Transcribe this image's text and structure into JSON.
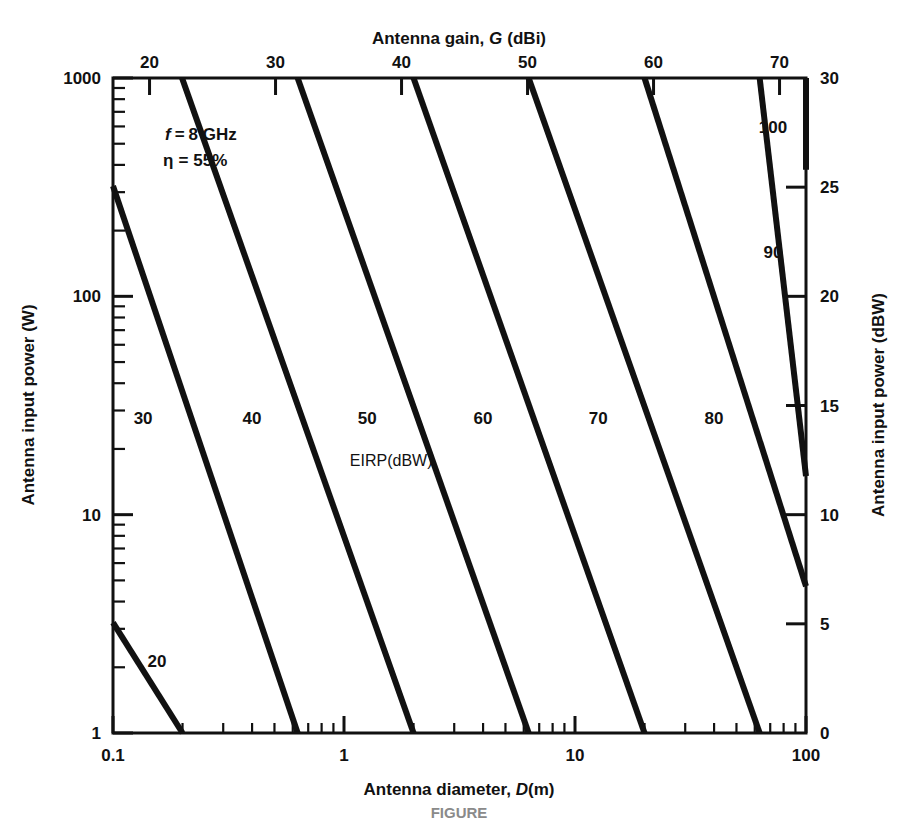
{
  "figure": {
    "kind": "nomogram",
    "caption_partial": "FIGURE",
    "background": "#ffffff",
    "ink": "#111111"
  },
  "annotations": {
    "frequency": {
      "symbol": "f",
      "relation": "=",
      "value": "8 GHz",
      "text": "f = 8 GHz"
    },
    "efficiency": {
      "symbol": "η",
      "relation": "=",
      "value": "55%",
      "text": "η = 55%"
    },
    "contour_family_label": "EIRP(dBW)"
  },
  "chart_data": {
    "type": "line",
    "title": "",
    "subtitle": "",
    "xlabel": "Antenna diameter, D(m)",
    "xlabel_symbol": "D",
    "xlabel_units": "(m)",
    "xlabel_prefix": "Antenna diameter, ",
    "ylabel": "Antenna input power (W)",
    "top_axis_label": "Antenna gain, G (dBi)",
    "top_axis_prefix": "Antenna gain, ",
    "top_axis_symbol": "G",
    "top_axis_units": "(dBi)",
    "right_axis_label": "Antenna input power (dBW)",
    "xscale": "log",
    "yscale": "log",
    "xlim": [
      0.1,
      100
    ],
    "ylim": [
      1,
      1000
    ],
    "grid": false,
    "legend_position": "inline-contour-labels",
    "x_ticks": [
      {
        "value": 0.1,
        "label": "0.1",
        "major": true
      },
      {
        "value": 1,
        "label": "1",
        "major": true
      },
      {
        "value": 10,
        "label": "10",
        "major": true
      },
      {
        "value": 100,
        "label": "100",
        "major": true
      }
    ],
    "y_ticks": [
      {
        "value": 1,
        "label": "1",
        "major": true
      },
      {
        "value": 10,
        "label": "10",
        "major": true
      },
      {
        "value": 100,
        "label": "100",
        "major": true
      },
      {
        "value": 1000,
        "label": "1000",
        "major": true
      }
    ],
    "top_ticks": [
      {
        "value": 20,
        "label": "20"
      },
      {
        "value": 30,
        "label": "30"
      },
      {
        "value": 40,
        "label": "40"
      },
      {
        "value": 50,
        "label": "50"
      },
      {
        "value": 60,
        "label": "60"
      },
      {
        "value": 70,
        "label": "70"
      }
    ],
    "right_ticks": [
      {
        "value": 0,
        "label": "0"
      },
      {
        "value": 5,
        "label": "5"
      },
      {
        "value": 10,
        "label": "10"
      },
      {
        "value": 15,
        "label": "15"
      },
      {
        "value": 20,
        "label": "20"
      },
      {
        "value": 25,
        "label": "25"
      },
      {
        "value": 30,
        "label": "30"
      }
    ],
    "top_axis_range_dbi": [
      17.1,
      72.1
    ],
    "right_axis_range_dbw": [
      0,
      30
    ],
    "contour_quantity": "EIRP",
    "contour_units": "dBW",
    "contour_relation": "EIRP(dBW) = P(dBW) + G(dBi)",
    "contour_slope_db_per_decade_diameter": -20,
    "series": [
      {
        "name": "20",
        "label": "20",
        "eirp_dbw": 20,
        "start": {
          "x": 0.1,
          "y": 3.2
        },
        "end": {
          "x": 0.2,
          "y": 1.0
        },
        "label_at": {
          "x": 0.155,
          "y": 2.0
        }
      },
      {
        "name": "30",
        "label": "30",
        "eirp_dbw": 30,
        "start": {
          "x": 0.1,
          "y": 320
        },
        "end": {
          "x": 0.63,
          "y": 1.0
        },
        "label_at": {
          "x": 0.135,
          "y": 26
        }
      },
      {
        "name": "40",
        "label": "40",
        "eirp_dbw": 40,
        "start": {
          "x": 0.199,
          "y": 1000
        },
        "end": {
          "x": 2.0,
          "y": 1.0
        },
        "label_at": {
          "x": 0.4,
          "y": 26
        }
      },
      {
        "name": "50",
        "label": "50",
        "eirp_dbw": 50,
        "start": {
          "x": 0.63,
          "y": 1000
        },
        "end": {
          "x": 6.3,
          "y": 1.0
        },
        "label_at": {
          "x": 1.26,
          "y": 26
        }
      },
      {
        "name": "60",
        "label": "60",
        "eirp_dbw": 60,
        "start": {
          "x": 2.0,
          "y": 1000
        },
        "end": {
          "x": 20,
          "y": 1.0
        },
        "label_at": {
          "x": 4.0,
          "y": 26
        }
      },
      {
        "name": "70",
        "label": "70",
        "eirp_dbw": 70,
        "start": {
          "x": 6.3,
          "y": 1000
        },
        "end": {
          "x": 63,
          "y": 1.0
        },
        "label_at": {
          "x": 12.6,
          "y": 26
        }
      },
      {
        "name": "80",
        "label": "80",
        "eirp_dbw": 80,
        "start": {
          "x": 20,
          "y": 1000
        },
        "end": {
          "x": 100,
          "y": 4.7
        },
        "label_at": {
          "x": 40,
          "y": 26
        }
      },
      {
        "name": "90",
        "label": "90",
        "eirp_dbw": 90,
        "start": {
          "x": 63,
          "y": 1000
        },
        "end": {
          "x": 100,
          "y": 15
        },
        "label_at": {
          "x": 72,
          "y": 150
        }
      },
      {
        "name": "100",
        "label": "100",
        "eirp_dbw": 100,
        "start": {
          "x": 100,
          "y": 1000
        },
        "end": {
          "x": 100,
          "y": 380
        },
        "label_at": {
          "x": 72,
          "y": 560
        }
      }
    ],
    "eirp_legend_at": {
      "x": 1.6,
      "y": 27
    }
  }
}
